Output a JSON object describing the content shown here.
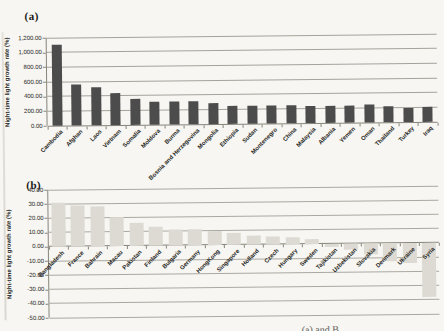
{
  "figure": {
    "background_color": "#f7f6f2",
    "caption_fragment": "(a) and B"
  },
  "chart_data": [
    {
      "id": "a",
      "type": "bar",
      "panel_label": "(a)",
      "ylabel": "Night-time light growth rate (%)",
      "xlabel": "",
      "ylim": [
        0,
        1200
      ],
      "grid": true,
      "legend": false,
      "bar_color": "#4c4c4c",
      "ytick_values": [
        1200,
        1000,
        800,
        600,
        400,
        200,
        0
      ],
      "ytick_labels": [
        "1,200.00",
        "1,000.00",
        "800.00",
        "600.00",
        "400.00",
        "200.00",
        "0.00"
      ],
      "categories": [
        "Cambodia",
        "Afghan",
        "Laos",
        "Vietnam",
        "Somalia",
        "Moldova",
        "Burma",
        "Bosnia and Herzegovina",
        "Mongolia",
        "Ethiopia",
        "Sudan",
        "Montenegro",
        "China",
        "Malaysia",
        "Albania",
        "Yemen",
        "Oman",
        "Thailand",
        "Turkey",
        "Iraq"
      ],
      "values": [
        1100,
        555,
        525,
        440,
        350,
        312,
        308,
        316,
        282,
        246,
        250,
        240,
        242,
        232,
        234,
        238,
        244,
        224,
        194,
        198
      ]
    },
    {
      "id": "b",
      "type": "bar",
      "panel_label": "(b)",
      "ylabel": "Night-time light growth rate (%)",
      "xlabel": "",
      "ylim": [
        -50,
        40
      ],
      "grid": true,
      "legend": false,
      "bar_color": "#dcdad2",
      "ytick_values": [
        40,
        30,
        20,
        10,
        0,
        -10,
        -20,
        -30,
        -40,
        -50
      ],
      "ytick_labels": [
        "40.00",
        "30.00",
        "20.00",
        "10.00",
        "0.00",
        "-10.00",
        "-20.00",
        "-30.00",
        "-40.00",
        "-50.00"
      ],
      "categories": [
        "Bangladesh",
        "France",
        "Bahrain",
        "Macau",
        "Pakistan",
        "Finland",
        "Bulgaria",
        "Germany",
        "HongKong",
        "Singapore",
        "Holland",
        "Czech",
        "Hungary",
        "Sweden",
        "Tajikistan",
        "Uzbekistan",
        "Slovakia",
        "Denmark",
        "Ukraine",
        "Syria"
      ],
      "values": [
        31,
        29,
        28,
        20,
        16,
        13,
        11.5,
        11,
        9.5,
        8.5,
        6.5,
        5.5,
        4.5,
        3.5,
        -2,
        -4,
        -8,
        -13,
        -14,
        -38
      ]
    }
  ]
}
